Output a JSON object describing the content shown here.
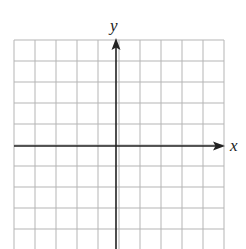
{
  "diagram": {
    "type": "coordinate-grid",
    "x_axis_label": "x",
    "y_axis_label": "y",
    "grid": {
      "columns": 10,
      "rows_visible": 10,
      "left": 14,
      "top": 40,
      "right": 224,
      "bottom": 249,
      "cell_size": 21,
      "line_color": "#b5b5b5"
    },
    "axes": {
      "origin_x": 116,
      "origin_y": 146,
      "color": "#222222",
      "x_arrow": "right",
      "y_arrow": "up"
    }
  }
}
